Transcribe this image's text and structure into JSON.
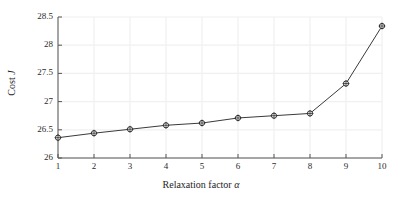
{
  "chart_data": {
    "type": "line",
    "title": "",
    "xlabel": "Relaxation factor α",
    "ylabel": "Cost J",
    "x": [
      1,
      2,
      3,
      4,
      5,
      6,
      7,
      8,
      9,
      10
    ],
    "values": [
      26.36,
      26.44,
      26.51,
      26.58,
      26.62,
      26.71,
      26.75,
      26.79,
      27.32,
      28.34
    ],
    "series": [
      {
        "name": "Cost J",
        "values": [
          26.36,
          26.44,
          26.51,
          26.58,
          26.62,
          26.71,
          26.75,
          26.79,
          27.32,
          28.34
        ]
      }
    ],
    "xlim": [
      1,
      10
    ],
    "ylim": [
      26,
      28.5
    ],
    "xticks": [
      "1",
      "2",
      "3",
      "4",
      "5",
      "6",
      "7",
      "8",
      "9",
      "10"
    ],
    "xtick_values": [
      1,
      2,
      3,
      4,
      5,
      6,
      7,
      8,
      9,
      10
    ],
    "yticks": [
      "26",
      "26.5",
      "27",
      "27.5",
      "28",
      "28.5"
    ],
    "ytick_values": [
      26,
      26.5,
      27,
      27.5,
      28,
      28.5
    ],
    "grid": true,
    "legend": null,
    "marker": "circle-open",
    "line_color": "#3a3a3a",
    "marker_color": "#2b2b2b",
    "grid_color": "#f0f0f0",
    "axis_color": "#555555",
    "background": "#ffffff"
  },
  "axis": {
    "xlabel_text": "Relaxation factor ",
    "xlabel_symbol": "α",
    "ylabel_text": "Cost ",
    "ylabel_symbol": "J"
  }
}
